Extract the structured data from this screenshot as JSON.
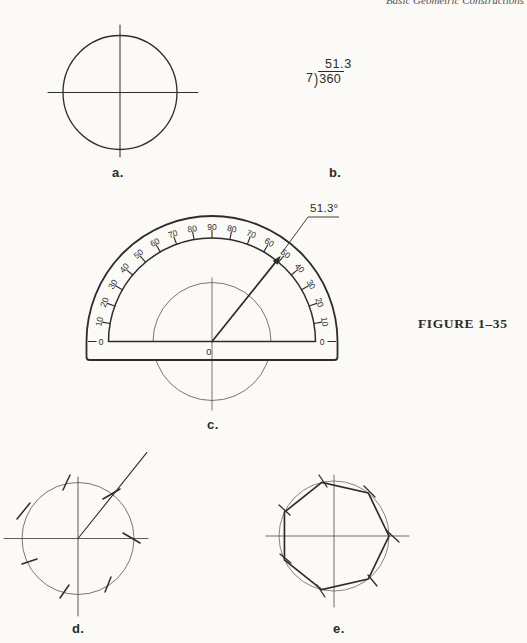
{
  "page": {
    "header_fragment": "Basic Geometric Constructions",
    "figure_caption": "FIGURE 1–35",
    "background": "#fbfaf6",
    "ink": "#2e2d2b",
    "construction_ink": "#6a6761"
  },
  "labels": {
    "a": "a.",
    "b": "b.",
    "c": "c.",
    "d": "d.",
    "e": "e."
  },
  "division": {
    "quotient": "51.3",
    "divisor": "7",
    "bracket": ")",
    "dividend": "360"
  },
  "figure_a": {
    "cx": 120,
    "cy": 92.5,
    "r": 57,
    "hline": [
      48,
      198
    ],
    "vline": [
      25,
      157
    ]
  },
  "protractor": {
    "cx": 212,
    "cy": 341.5,
    "outer_radius": 125.5,
    "inner_radius": 103.5,
    "body_bottom": 360,
    "corner": 3,
    "tick_len": 8,
    "tick_angles": [
      170,
      160,
      150,
      140,
      130,
      120,
      110,
      100,
      90,
      80,
      70,
      60,
      50,
      40,
      30,
      20,
      10
    ],
    "scale_values": [
      "10",
      "20",
      "30",
      "40",
      "50",
      "60",
      "70",
      "80",
      "90",
      "80",
      "70",
      "60",
      "50",
      "40",
      "30",
      "20",
      "10"
    ],
    "label_radius": 114.5,
    "zero_left": "0",
    "zero_right": "0",
    "center_label": "0",
    "construction_circle_radius": 59,
    "centerline_y": [
      278,
      410
    ],
    "ray_angle_deg": 51.3,
    "ray_tip_radius": 110,
    "angle_label": "51.3°",
    "leader": [
      [
        281,
        254
      ],
      [
        308,
        217
      ],
      [
        339,
        217
      ]
    ]
  },
  "figure_d": {
    "cx": 78,
    "cy": 538.5,
    "r": 56,
    "hline": [
      4,
      148
    ],
    "vline": [
      477,
      616
    ],
    "ray_angle_deg": 51.3,
    "ray_len": 110,
    "ticks": [
      [
        103,
        499,
        120,
        489
      ],
      [
        123,
        533,
        140,
        543
      ],
      [
        111,
        577,
        105,
        592
      ],
      [
        60,
        598,
        69,
        585
      ],
      [
        22,
        564,
        37,
        559
      ],
      [
        17,
        519,
        30,
        503
      ],
      [
        63,
        490,
        70,
        475
      ]
    ]
  },
  "figure_e": {
    "cx": 334,
    "cy": 536,
    "r": 55,
    "hline": [
      266,
      409
    ],
    "vline": [
      475,
      607
    ],
    "vertex_angles": [
      0,
      51.43,
      102.86,
      154.29,
      205.71,
      257.14,
      308.57
    ],
    "ticks": [
      [
        386,
        530,
        399,
        542
      ],
      [
        364,
        486,
        375,
        497
      ],
      [
        319,
        475,
        327,
        487
      ],
      [
        279,
        505,
        290,
        515
      ],
      [
        280,
        554,
        291,
        563
      ],
      [
        317,
        585,
        325,
        597
      ],
      [
        368,
        575,
        377,
        586
      ]
    ]
  }
}
